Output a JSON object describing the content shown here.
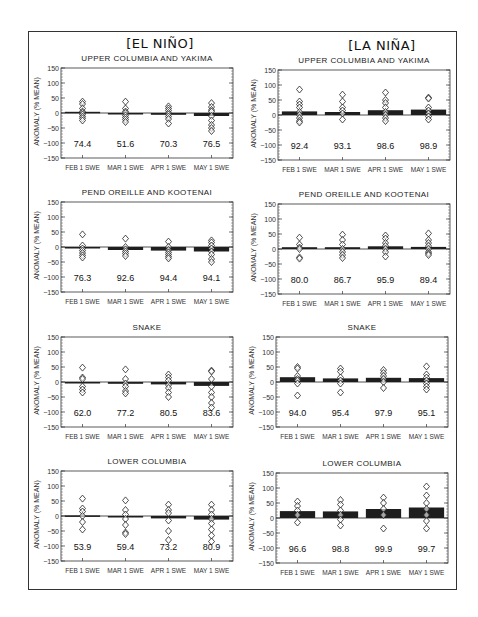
{
  "figure": {
    "columns": [
      {
        "title": "[EL NIÑO]"
      },
      {
        "title": "[LA NIÑA]"
      }
    ],
    "ylabel": "ANOMALY (% MEAN)",
    "yticks": [
      150,
      100,
      50,
      0,
      -50,
      -100,
      -150
    ],
    "categories": [
      "FEB 1 SWE",
      "MAR 1 SWE",
      "APR 1 SWE",
      "MAY 1 SWE"
    ]
  },
  "chart_data": [
    {
      "type": "bar",
      "title": "UPPER COLUMBIA AND YAKIMA",
      "group": "EL NIÑO",
      "xlabel": "",
      "ylabel": "ANOMALY (% MEAN)",
      "ylim": [
        -150,
        150
      ],
      "categories": [
        "FEB 1 SWE",
        "MAR 1 SWE",
        "APR 1 SWE",
        "MAY 1 SWE"
      ],
      "values": [
        4,
        -2,
        -6,
        -10
      ],
      "annotations": [
        "74.4",
        "51.6",
        "70.3",
        "76.5"
      ],
      "points": [
        [
          38,
          30,
          15,
          5,
          0,
          -5,
          -12,
          -18,
          -25
        ],
        [
          38,
          15,
          5,
          0,
          -8,
          -15,
          -22,
          -30
        ],
        [
          22,
          15,
          8,
          0,
          -5,
          -12,
          -20,
          -35
        ],
        [
          33,
          20,
          10,
          5,
          -10,
          -25,
          -40,
          -50,
          -60
        ]
      ]
    },
    {
      "type": "bar",
      "title": "UPPER COLUMBIA AND YAKIMA",
      "group": "LA NIÑA",
      "xlabel": "",
      "ylabel": "ANOMALY (% MEAN)",
      "ylim": [
        -150,
        150
      ],
      "categories": [
        "FEB 1 SWE",
        "MAR 1 SWE",
        "APR 1 SWE",
        "MAY 1 SWE"
      ],
      "values": [
        12,
        10,
        16,
        18
      ],
      "annotations": [
        "92.4",
        "93.1",
        "98.6",
        "98.9"
      ],
      "points": [
        [
          85,
          45,
          35,
          25,
          10,
          0,
          -10,
          -20,
          -25
        ],
        [
          68,
          45,
          25,
          15,
          5,
          -15
        ],
        [
          75,
          50,
          40,
          25,
          10,
          0,
          -10,
          -20
        ],
        [
          58,
          55,
          25,
          15,
          5,
          -5,
          -15
        ]
      ]
    },
    {
      "type": "bar",
      "title": "PEND OREILLE AND KOOTENAI",
      "group": "EL NIÑO",
      "xlabel": "",
      "ylabel": "ANOMALY (% MEAN)",
      "ylim": [
        -150,
        150
      ],
      "categories": [
        "FEB 1 SWE",
        "MAR 1 SWE",
        "APR 1 SWE",
        "MAY 1 SWE"
      ],
      "values": [
        -5,
        -10,
        -12,
        -15
      ],
      "annotations": [
        "76.3",
        "92.6",
        "94.4",
        "94.1"
      ],
      "points": [
        [
          42,
          5,
          -5,
          -12,
          -20,
          -28,
          -35
        ],
        [
          28,
          0,
          -8,
          -15,
          -22,
          -30
        ],
        [
          18,
          0,
          -10,
          -18,
          -25,
          -32,
          -38
        ],
        [
          22,
          15,
          5,
          -5,
          -15,
          -25,
          -40,
          -50
        ]
      ]
    },
    {
      "type": "bar",
      "title": "PEND OREILLE AND KOOTENAI",
      "group": "LA NIÑA",
      "xlabel": "",
      "ylabel": "ANOMALY (% MEAN)",
      "ylim": [
        -150,
        150
      ],
      "categories": [
        "FEB 1 SWE",
        "MAR 1 SWE",
        "APR 1 SWE",
        "MAY 1 SWE"
      ],
      "values": [
        6,
        6,
        9,
        7
      ],
      "annotations": [
        "80.0",
        "86.7",
        "95.9",
        "89.4"
      ],
      "points": [
        [
          38,
          15,
          5,
          0,
          -28,
          -32
        ],
        [
          48,
          30,
          15,
          0,
          -10,
          -20,
          -30
        ],
        [
          45,
          35,
          20,
          10,
          0,
          -10,
          -25
        ],
        [
          52,
          30,
          20,
          10,
          0,
          -10,
          -15,
          -20
        ]
      ]
    },
    {
      "type": "bar",
      "title": "SNAKE",
      "group": "EL NIÑO",
      "xlabel": "",
      "ylabel": "ANOMALY (% MEAN)",
      "ylim": [
        -150,
        150
      ],
      "categories": [
        "FEB 1 SWE",
        "MAR 1 SWE",
        "APR 1 SWE",
        "MAY 1 SWE"
      ],
      "values": [
        -3,
        -6,
        -8,
        -13
      ],
      "annotations": [
        "62.0",
        "77.2",
        "80.5",
        "83.6"
      ],
      "points": [
        [
          48,
          15,
          10,
          -15,
          -25,
          -35
        ],
        [
          42,
          10,
          -5,
          -15,
          -30,
          -38
        ],
        [
          25,
          15,
          5,
          -10,
          -20,
          -35,
          -50
        ],
        [
          38,
          35,
          10,
          -15,
          -35,
          -50,
          -70,
          -85
        ]
      ]
    },
    {
      "type": "bar",
      "title": "SNAKE",
      "group": "LA NIÑA",
      "xlabel": "",
      "ylabel": "ANOMALY (% MEAN)",
      "ylim": [
        -150,
        150
      ],
      "categories": [
        "FEB 1 SWE",
        "MAR 1 SWE",
        "APR 1 SWE",
        "MAY 1 SWE"
      ],
      "values": [
        16,
        12,
        14,
        13
      ],
      "annotations": [
        "94.0",
        "95.4",
        "97.9",
        "95.1"
      ],
      "points": [
        [
          50,
          45,
          20,
          10,
          5,
          -5,
          -45
        ],
        [
          45,
          35,
          15,
          5,
          -5,
          -35
        ],
        [
          40,
          30,
          20,
          10,
          0,
          -20
        ],
        [
          52,
          25,
          15,
          5,
          -5,
          -15,
          -25
        ]
      ]
    },
    {
      "type": "bar",
      "title": "LOWER COLUMBIA",
      "group": "EL NIÑO",
      "xlabel": "",
      "ylabel": "ANOMALY (% MEAN)",
      "ylim": [
        -150,
        150
      ],
      "categories": [
        "FEB 1 SWE",
        "MAR 1 SWE",
        "APR 1 SWE",
        "MAY 1 SWE"
      ],
      "values": [
        2,
        -4,
        -8,
        -12
      ],
      "annotations": [
        "53.9",
        "59.4",
        "73.2",
        "80.9"
      ],
      "points": [
        [
          58,
          25,
          15,
          0,
          -20,
          -45
        ],
        [
          52,
          20,
          5,
          -10,
          -30,
          -55,
          -60
        ],
        [
          38,
          20,
          10,
          -15,
          -50,
          -80
        ],
        [
          38,
          20,
          5,
          -10,
          -25,
          -45,
          -65,
          -85
        ]
      ]
    },
    {
      "type": "bar",
      "title": "LOWER COLUMBIA",
      "group": "LA NIÑA",
      "xlabel": "",
      "ylabel": "ANOMALY (% MEAN)",
      "ylim": [
        -150,
        150
      ],
      "categories": [
        "FEB 1 SWE",
        "MAR 1 SWE",
        "APR 1 SWE",
        "MAY 1 SWE"
      ],
      "values": [
        23,
        22,
        30,
        35
      ],
      "annotations": [
        "96.6",
        "98.8",
        "99.9",
        "99.7"
      ],
      "points": [
        [
          55,
          40,
          25,
          10,
          -15
        ],
        [
          60,
          45,
          25,
          10,
          -5,
          -25
        ],
        [
          68,
          50,
          30,
          10,
          -35
        ],
        [
          105,
          75,
          50,
          30,
          10,
          -10,
          -35
        ]
      ]
    }
  ]
}
